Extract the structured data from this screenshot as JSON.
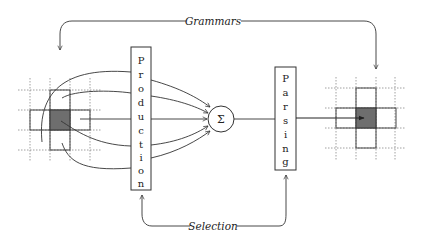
{
  "diagram": {
    "top_label": "Grammars",
    "bottom_label": "Selection",
    "production_box": {
      "label": "Production",
      "letters": [
        "P",
        "r",
        "o",
        "d",
        "u",
        "c",
        "t",
        "i",
        "o",
        "n"
      ]
    },
    "parsing_box": {
      "label": "Parsing",
      "letters": [
        "P",
        "a",
        "r",
        "s",
        "i",
        "n",
        "g"
      ]
    },
    "sum_node": {
      "symbol": "Σ"
    },
    "input_grid": {
      "description": "cross-shaped neighborhood with shaded center cell"
    },
    "output_grid": {
      "description": "cross-shaped neighborhood with shaded center cell"
    },
    "colors": {
      "line": "#333333",
      "dark_cell": "#6e6e6e",
      "dotted_grid": "#888888"
    }
  }
}
